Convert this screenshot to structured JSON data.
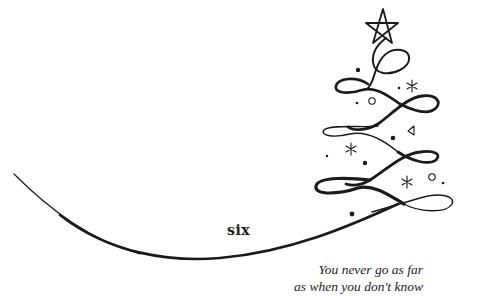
{
  "page": {
    "chapter_label": "six",
    "epigraph": {
      "lines": [
        "You never go as far",
        "as when you don't know"
      ]
    },
    "illustration": {
      "subject": "christmas-tree-swirl",
      "elements": [
        "star-icon",
        "swirl-tree",
        "sweeping-curve",
        "ornament-dots",
        "snowflake-icons",
        "circle-ornaments",
        "triangle-ornament"
      ],
      "ink_color": "#1a1a1a",
      "background": "#ffffff"
    }
  }
}
